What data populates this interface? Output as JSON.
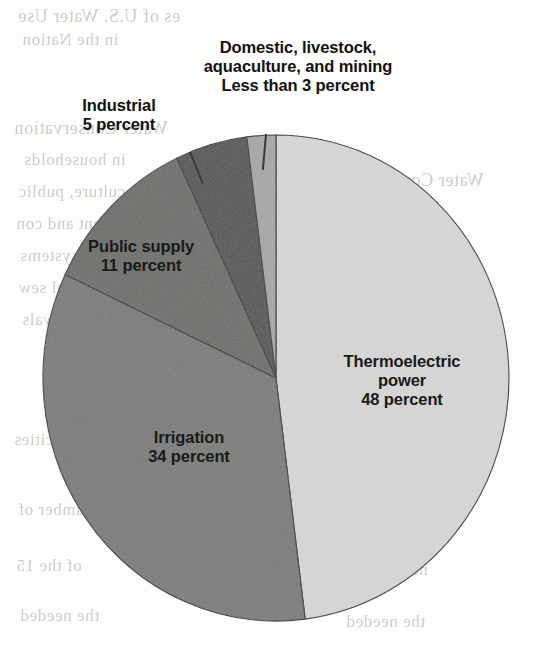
{
  "figure": {
    "kind": "pie-chart",
    "background_color": "#fdfdfc"
  },
  "chart_data": {
    "type": "pie",
    "title": "",
    "subtitle": "",
    "xlabel": "",
    "ylabel": "",
    "units": "percent",
    "start_angle_deg": 0,
    "direction": "clockwise",
    "legend_position": "none",
    "grid": false,
    "categories": [
      "Thermoelectric power",
      "Irrigation",
      "Public supply",
      "Industrial",
      "Domestic, livestock, aquaculture, and mining"
    ],
    "values": [
      48,
      34,
      11,
      5,
      2
    ],
    "value_labels": [
      "48 percent",
      "34 percent",
      "11 percent",
      "5 percent",
      "Less than 3 percent"
    ],
    "colors": [
      "#d7d7d5",
      "#7b7b79",
      "#6d6d6b",
      "#545452",
      "#a7a7a5"
    ],
    "slices": [
      {
        "name": "Thermoelectric power",
        "label_line1": "Thermoelectric",
        "label_line2": "power",
        "label_line3": "48 percent",
        "value": 48,
        "value_text": "48 percent",
        "color": "#d7d7d5",
        "label_placement": "inside"
      },
      {
        "name": "Irrigation",
        "label_line1": "Irrigation",
        "label_line2": "34 percent",
        "value": 34,
        "value_text": "34 percent",
        "color": "#7b7b79",
        "label_placement": "inside"
      },
      {
        "name": "Public supply",
        "label_line1": "Public supply",
        "label_line2": "11 percent",
        "value": 11,
        "value_text": "11 percent",
        "color": "#6d6d6b",
        "label_placement": "inside"
      },
      {
        "name": "Industrial",
        "label_line1": "Industrial",
        "label_line2": "5 percent",
        "value": 5,
        "value_text": "5 percent",
        "color": "#545452",
        "label_placement": "outside-leader"
      },
      {
        "name": "Domestic, livestock, aquaculture, and mining",
        "label_line1": "Domestic, livestock,",
        "label_line2": "aquaculture, and mining",
        "label_line3": "Less than 3 percent",
        "value": 2,
        "value_text": "Less than 3 percent",
        "color": "#a7a7a5",
        "label_placement": "outside-leader"
      }
    ]
  },
  "labels": {
    "domestic": "Domestic, livestock,\naquaculture, and mining\nLess than 3 percent",
    "industrial": "Industrial\n5 percent",
    "public_supply": "Public supply\n11 percent",
    "irrigation": "Irrigation\n34 percent",
    "thermoelectric": "Thermoelectric\npower\n48 percent"
  },
  "bleedthrough": {
    "note": "faint mirrored text showing through from the reverse side of the printed page",
    "lines": [
      "es of U.S. Water Use",
      "in the Nation",
      "Water Conservation",
      "in households",
      "culture, public",
      "pment and con",
      "aquifer systems",
      "municipal sew",
      "withdrawals",
      "capacities",
      "number of",
      "of the 15",
      "the needed"
    ]
  }
}
